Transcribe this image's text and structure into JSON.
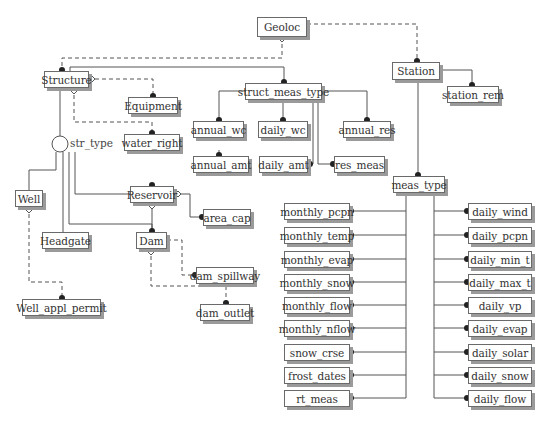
{
  "diagram": {
    "title": "",
    "entities": {
      "geoloc": "Geoloc",
      "station": "Station",
      "station_rem": "station_rem",
      "structure": "Structure",
      "equipment": "Equipment",
      "water_right": "water_right",
      "struct_meas_type": "struct_meas_type",
      "annual_wc": "annual_wc",
      "daily_wc": "daily_wc",
      "annual_res": "annual_res",
      "annual_amt": "annual_amt",
      "daily_amt": "daily_amt",
      "res_meas": "res_meas",
      "well": "Well",
      "headgate": "Headgate",
      "reservoir": "Reservoir",
      "area_cap": "area_cap",
      "dam": "Dam",
      "dam_spillway": "dam_spillway",
      "dam_outlet": "dam_outlet",
      "well_appl_permit": "Well_appl_permit",
      "meas_type": "meas_type"
    },
    "subtype_discriminator": "str_type",
    "meas_type_left": [
      "monthly_pcpn",
      "monthly_temp",
      "monthly_evap",
      "monthly_snow",
      "monthly_flow",
      "monthly_nflow",
      "snow_crse",
      "frost_dates",
      "rt_meas"
    ],
    "meas_type_right": [
      "daily_wind",
      "daily_pcpn",
      "daily_min_t",
      "daily_max_t",
      "daily_vp",
      "daily_evap",
      "daily_solar",
      "daily_snow",
      "daily_flow"
    ],
    "colors": {
      "line": "#555555",
      "box_border": "#6a6a6a",
      "shadow": "#9a9a9a",
      "dot": "#222222"
    }
  }
}
